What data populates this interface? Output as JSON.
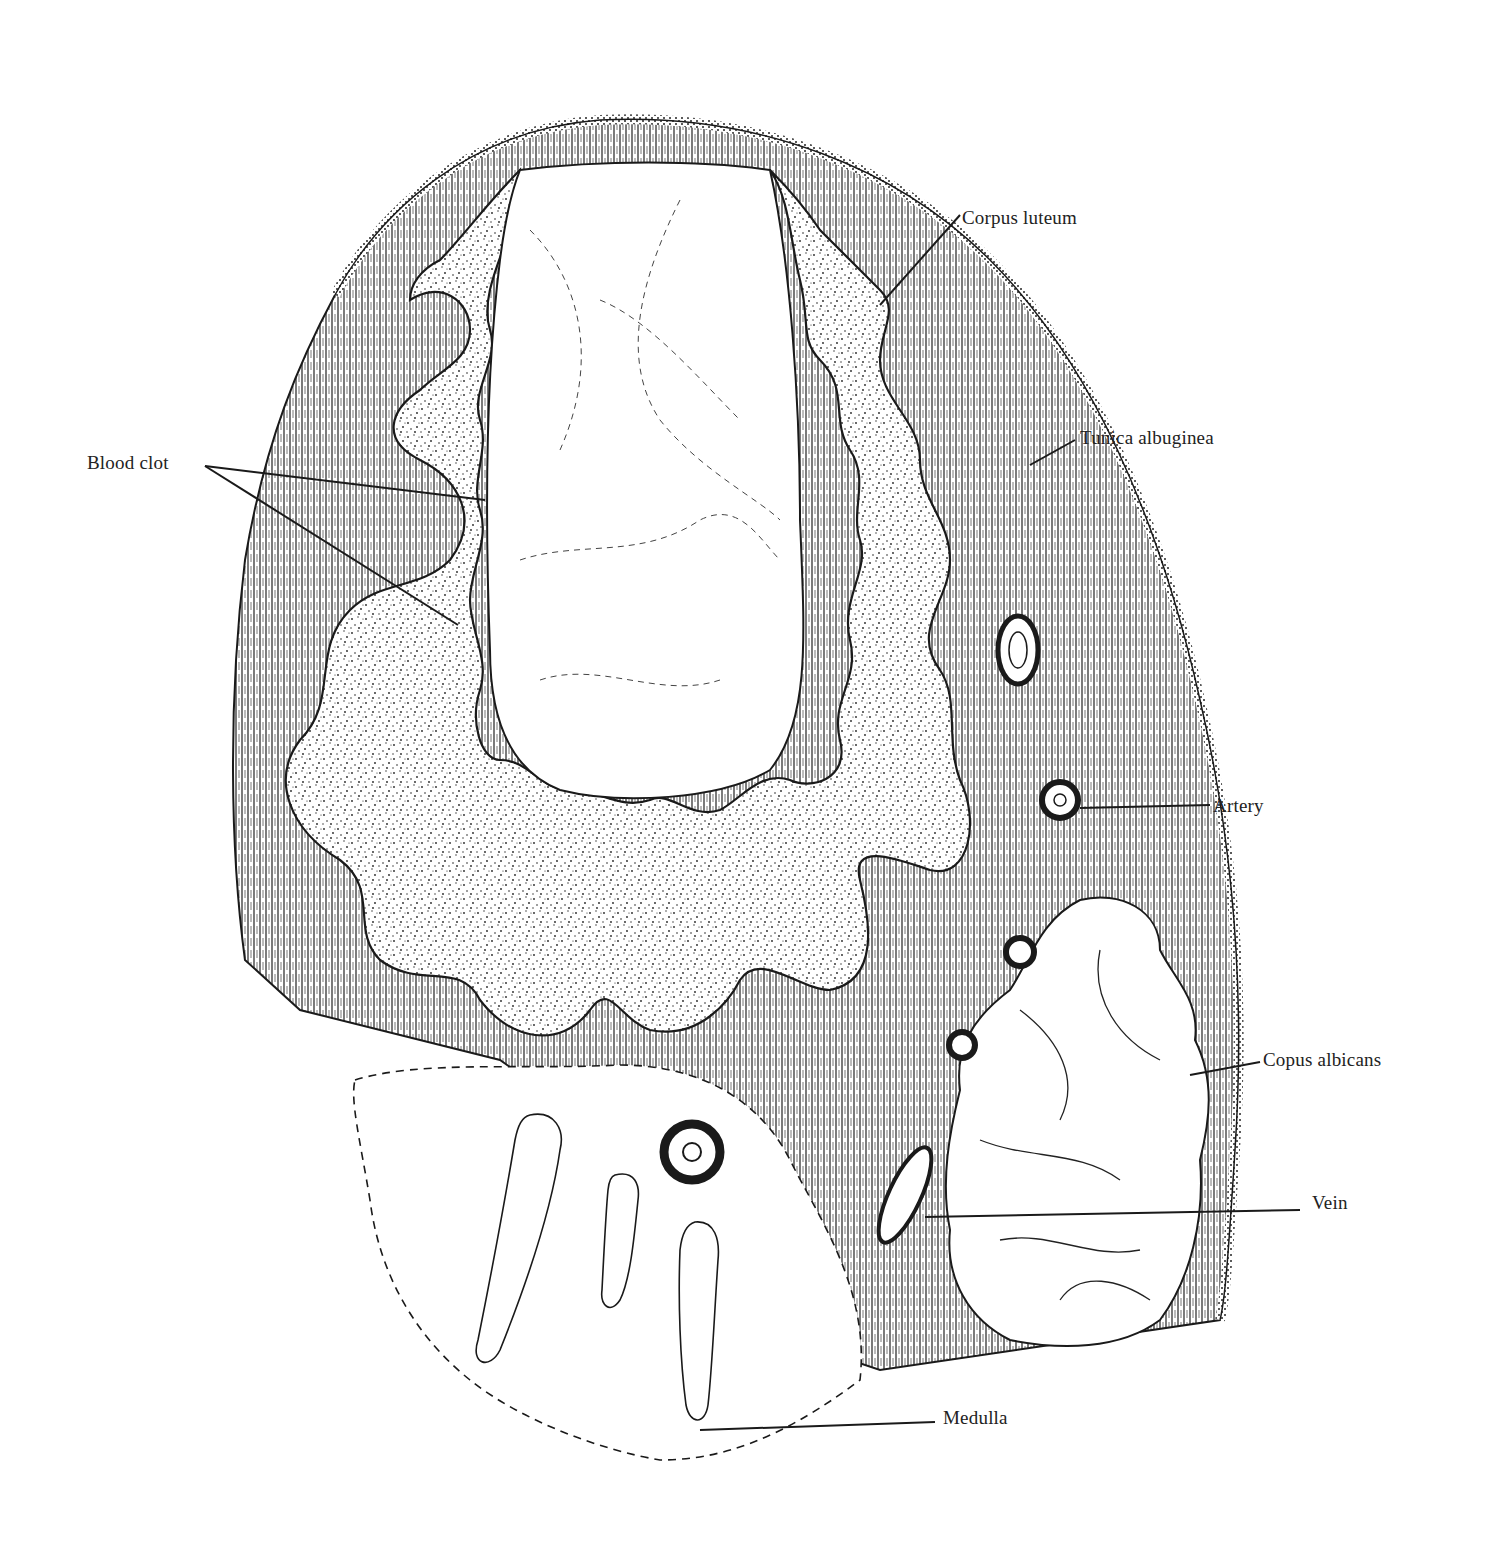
{
  "figure": {
    "labels": {
      "corpus_luteum": "Corpus luteum",
      "tunica_albuginea": "Tunica albuginea",
      "blood_clot": "Blood clot",
      "artery": "Artery",
      "corpus_albicans": "Copus albicans",
      "vein": "Vein",
      "medulla": "Medulla"
    },
    "colors": {
      "ink": "#1a1a1a",
      "paper": "#ffffff",
      "stroma": "#4a4a4a"
    }
  }
}
